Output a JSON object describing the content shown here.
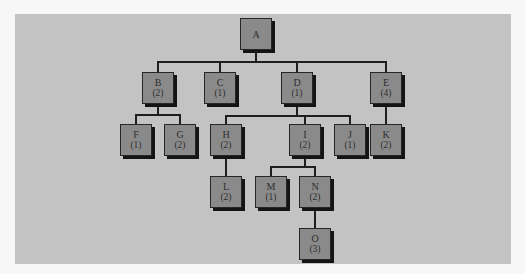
{
  "diagram": {
    "type": "tree",
    "colors": {
      "panel_background": "#c3c3c3",
      "node_fill": "#8a8a8a",
      "node_border": "#262626",
      "edge": "#1e1e1e",
      "text": "#2e2e2e"
    },
    "nodes": {
      "A": {
        "label": "A",
        "count": ""
      },
      "B": {
        "label": "B",
        "count": "(2)"
      },
      "C": {
        "label": "C",
        "count": "(1)"
      },
      "D": {
        "label": "D",
        "count": "(1)"
      },
      "E": {
        "label": "E",
        "count": "(4)"
      },
      "F": {
        "label": "F",
        "count": "(1)"
      },
      "G": {
        "label": "G",
        "count": "(2)"
      },
      "H": {
        "label": "H",
        "count": "(2)"
      },
      "I": {
        "label": "I",
        "count": "(2)"
      },
      "J": {
        "label": "J",
        "count": "(1)"
      },
      "K": {
        "label": "K",
        "count": "(2)"
      },
      "L": {
        "label": "L",
        "count": "(2)"
      },
      "M": {
        "label": "M",
        "count": "(1)"
      },
      "N": {
        "label": "N",
        "count": "(2)"
      },
      "O": {
        "label": "O",
        "count": "(3)"
      }
    },
    "edges": [
      [
        "A",
        "B"
      ],
      [
        "A",
        "C"
      ],
      [
        "A",
        "D"
      ],
      [
        "A",
        "E"
      ],
      [
        "B",
        "F"
      ],
      [
        "B",
        "G"
      ],
      [
        "D",
        "H"
      ],
      [
        "D",
        "I"
      ],
      [
        "D",
        "J"
      ],
      [
        "E",
        "K"
      ],
      [
        "H",
        "L"
      ],
      [
        "I",
        "M"
      ],
      [
        "I",
        "N"
      ],
      [
        "N",
        "O"
      ]
    ]
  }
}
